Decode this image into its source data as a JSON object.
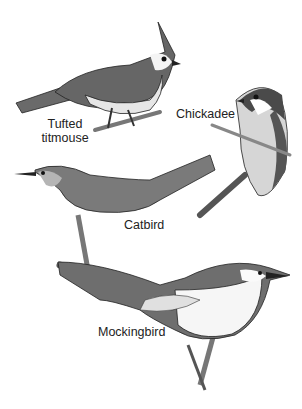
{
  "figure": {
    "birds": [
      {
        "name": "tufted-titmouse",
        "label_line1": "Tufted",
        "label_line2": "titmouse"
      },
      {
        "name": "chickadee",
        "label": "Chickadee"
      },
      {
        "name": "catbird",
        "label": "Catbird"
      },
      {
        "name": "mockingbird",
        "label": "Mockingbird"
      }
    ],
    "colors": {
      "dark": "#3a3a3a",
      "mid": "#6e6e6e",
      "light": "#bdbdbd",
      "white": "#ffffff"
    }
  }
}
